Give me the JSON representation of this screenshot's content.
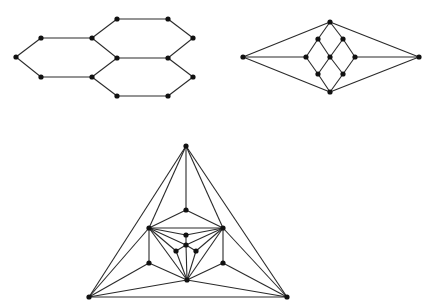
{
  "style": {
    "edge_color": "#2a2a2a",
    "node_color": "#111111",
    "node_radius": 2.6,
    "background": "#ffffff"
  },
  "graphs": [
    {
      "name": "hexagon-graph",
      "nodes": {
        "a": [
          16,
          57
        ],
        "b": [
          41,
          38
        ],
        "c": [
          41,
          77
        ],
        "d": [
          92,
          38
        ],
        "e": [
          92,
          77
        ],
        "f": [
          117,
          19
        ],
        "g": [
          168,
          19
        ],
        "h": [
          193,
          38
        ],
        "i": [
          117,
          58
        ],
        "j": [
          168,
          58
        ],
        "k": [
          193,
          77
        ],
        "l": [
          117,
          96
        ],
        "m": [
          168,
          96
        ]
      },
      "edges": [
        [
          "a",
          "b"
        ],
        [
          "a",
          "c"
        ],
        [
          "b",
          "d"
        ],
        [
          "c",
          "e"
        ],
        [
          "d",
          "i"
        ],
        [
          "e",
          "i"
        ],
        [
          "d",
          "f"
        ],
        [
          "f",
          "g"
        ],
        [
          "g",
          "h"
        ],
        [
          "h",
          "j"
        ],
        [
          "i",
          "j"
        ],
        [
          "e",
          "l"
        ],
        [
          "l",
          "m"
        ],
        [
          "m",
          "k"
        ],
        [
          "k",
          "j"
        ]
      ]
    },
    {
      "name": "diamond-graph",
      "nodes": {
        "fl": [
          243,
          57
        ],
        "fr": [
          419,
          57
        ],
        "top": [
          330,
          22
        ],
        "ul": [
          318,
          39
        ],
        "ur": [
          343,
          39
        ],
        "ml": [
          306,
          57
        ],
        "c": [
          330,
          57
        ],
        "mr": [
          355,
          57
        ],
        "ll": [
          318,
          74
        ],
        "lr": [
          343,
          74
        ],
        "bot": [
          330,
          92
        ]
      },
      "edges": [
        [
          "fl",
          "top"
        ],
        [
          "fl",
          "ml"
        ],
        [
          "fl",
          "bot"
        ],
        [
          "fr",
          "top"
        ],
        [
          "fr",
          "mr"
        ],
        [
          "fr",
          "bot"
        ],
        [
          "top",
          "ul"
        ],
        [
          "top",
          "ur"
        ],
        [
          "ul",
          "ml"
        ],
        [
          "ul",
          "c"
        ],
        [
          "ur",
          "c"
        ],
        [
          "ur",
          "mr"
        ],
        [
          "ml",
          "ll"
        ],
        [
          "c",
          "ll"
        ],
        [
          "c",
          "lr"
        ],
        [
          "mr",
          "lr"
        ],
        [
          "ll",
          "bot"
        ],
        [
          "lr",
          "bot"
        ]
      ]
    },
    {
      "name": "triangle-graph",
      "nodes": {
        "apex": [
          186,
          146
        ],
        "bl": [
          89,
          297
        ],
        "br": [
          287,
          297
        ],
        "t": [
          186,
          210
        ],
        "L": [
          149,
          228
        ],
        "R": [
          223,
          228
        ],
        "LL": [
          149,
          263
        ],
        "LR": [
          223,
          263
        ],
        "B": [
          187,
          280
        ],
        "c1": [
          186,
          235
        ],
        "c2": [
          186,
          245
        ],
        "c3": [
          176,
          251
        ],
        "c4": [
          196,
          251
        ]
      },
      "edges": [
        [
          "apex",
          "bl"
        ],
        [
          "apex",
          "br"
        ],
        [
          "bl",
          "br"
        ],
        [
          "apex",
          "t"
        ],
        [
          "apex",
          "L"
        ],
        [
          "apex",
          "R"
        ],
        [
          "t",
          "L"
        ],
        [
          "t",
          "R"
        ],
        [
          "L",
          "R"
        ],
        [
          "L",
          "LL"
        ],
        [
          "R",
          "LR"
        ],
        [
          "bl",
          "L"
        ],
        [
          "bl",
          "LL"
        ],
        [
          "bl",
          "B"
        ],
        [
          "br",
          "R"
        ],
        [
          "br",
          "LR"
        ],
        [
          "br",
          "B"
        ],
        [
          "LL",
          "B"
        ],
        [
          "LR",
          "B"
        ],
        [
          "L",
          "c1"
        ],
        [
          "L",
          "c2"
        ],
        [
          "L",
          "c3"
        ],
        [
          "L",
          "B"
        ],
        [
          "R",
          "c1"
        ],
        [
          "R",
          "c2"
        ],
        [
          "R",
          "c4"
        ],
        [
          "R",
          "B"
        ],
        [
          "c1",
          "c2"
        ],
        [
          "c2",
          "c3"
        ],
        [
          "c2",
          "c4"
        ],
        [
          "c2",
          "B"
        ],
        [
          "c3",
          "B"
        ],
        [
          "c4",
          "B"
        ]
      ]
    }
  ]
}
